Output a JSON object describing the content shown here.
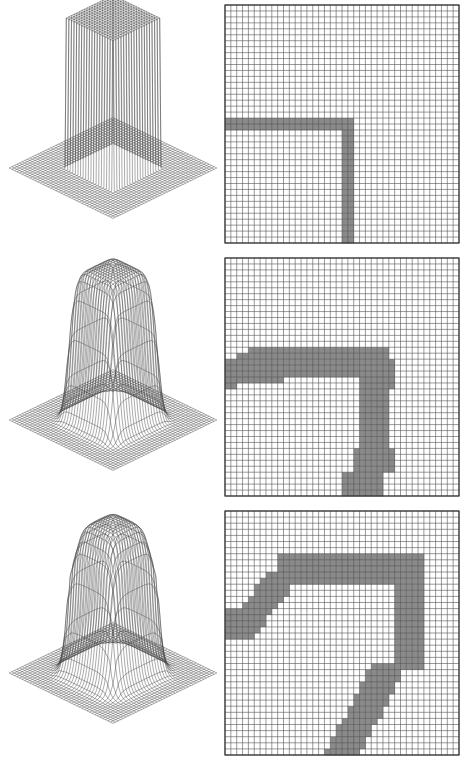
{
  "figure": {
    "rows": [
      {
        "id": "row1",
        "surface": {
          "top_y": 0,
          "cube_height": 1.0,
          "edge_rounding": 0.0,
          "overshoot": 0.0
        },
        "grid": {
          "top_y": 4,
          "n": 40,
          "shape": "L",
          "desc": "sharp L-shaped band: horizontal bar from left edge to col 21 at rows 19-20, vertical bar at cols 20-21 from row 19 to bottom"
        }
      },
      {
        "id": "row2",
        "surface": {
          "top_y": 252,
          "cube_height": 1.0,
          "edge_rounding": 0.35,
          "overshoot": 0.0
        },
        "grid": {
          "top_y": 257,
          "n": 40,
          "shape": "blurred-L",
          "desc": "wider irregular L band with bulges, smoothed corner"
        }
      },
      {
        "id": "row3",
        "surface": {
          "top_y": 505,
          "cube_height": 1.0,
          "edge_rounding": 0.55,
          "overshoot": 0.12
        },
        "grid": {
          "top_y": 510,
          "n": 40,
          "shape": "rotated-hook",
          "desc": "band forming a diagonal hook: diagonal upper-left arm, horizontal top arm, right vertical arm curving down-left"
        }
      }
    ],
    "colors": {
      "grid_line": "#555555",
      "fill": "#8a8a8a",
      "background": "#ffffff",
      "frame": "#333333"
    }
  }
}
